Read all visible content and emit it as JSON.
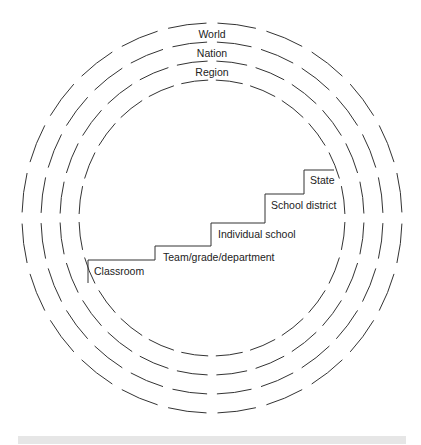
{
  "diagram": {
    "circles": {
      "center": [
        212,
        218
      ],
      "radii": [
        [
          190,
          195
        ],
        [
          171,
          176
        ],
        [
          152,
          157
        ],
        [
          133,
          138
        ]
      ],
      "stroke": "#333333",
      "segments": 24
    },
    "circle_labels": [
      {
        "text": "World",
        "x": 212,
        "y": 38
      },
      {
        "text": "Nation",
        "x": 212,
        "y": 57
      },
      {
        "text": "Region",
        "x": 212,
        "y": 76
      }
    ],
    "staircase": {
      "points": [
        [
          88,
          283
        ],
        [
          88,
          260
        ],
        [
          155,
          260
        ],
        [
          155,
          246
        ],
        [
          211,
          246
        ],
        [
          211,
          223
        ],
        [
          265,
          223
        ],
        [
          265,
          194
        ],
        [
          304,
          194
        ],
        [
          304,
          170
        ],
        [
          334,
          170
        ]
      ],
      "stroke": "#333333"
    },
    "step_labels": [
      {
        "text": "Classroom",
        "x": 94,
        "y": 275
      },
      {
        "text": "Team/grade/department",
        "x": 163,
        "y": 261
      },
      {
        "text": "Individual school",
        "x": 218,
        "y": 238
      },
      {
        "text": "School district",
        "x": 271,
        "y": 209
      },
      {
        "text": "State",
        "x": 310,
        "y": 184
      }
    ]
  }
}
